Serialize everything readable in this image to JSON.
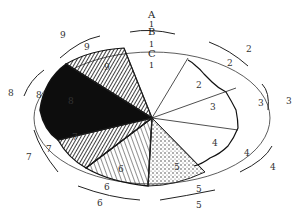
{
  "diagram": {
    "type": "sector-ring-diagram",
    "ring_labels": [
      "A",
      "B",
      "C"
    ],
    "ring_ticks": [
      "1",
      "1",
      "1"
    ],
    "sectors": [
      {
        "id": "1",
        "texture": "plain",
        "inner": "1",
        "outer": "1"
      },
      {
        "id": "2",
        "texture": "plain",
        "inner": "2",
        "mid": "2",
        "outer": "2"
      },
      {
        "id": "3",
        "texture": "plain",
        "inner": "3",
        "mid": "3",
        "outer": "3"
      },
      {
        "id": "4",
        "texture": "plain",
        "inner": "4",
        "mid": "4",
        "outer": "4"
      },
      {
        "id": "5",
        "texture": "stippled",
        "inner": "5",
        "mid": "5",
        "outer": "5"
      },
      {
        "id": "6",
        "texture": "dense-hatched-light",
        "inner": "6",
        "mid": "6",
        "outer": "6"
      },
      {
        "id": "7",
        "texture": "hatched",
        "inner": "7",
        "mid": "7",
        "outer": "7"
      },
      {
        "id": "8",
        "texture": "solid-dark",
        "inner": "8",
        "mid": "8",
        "outer": "8"
      },
      {
        "id": "9",
        "texture": "dark-hatched",
        "inner": "9",
        "mid": "9",
        "outer": "9"
      }
    ],
    "colors": {
      "ink": "#1a1a1a",
      "paper": "#ffffff"
    }
  }
}
